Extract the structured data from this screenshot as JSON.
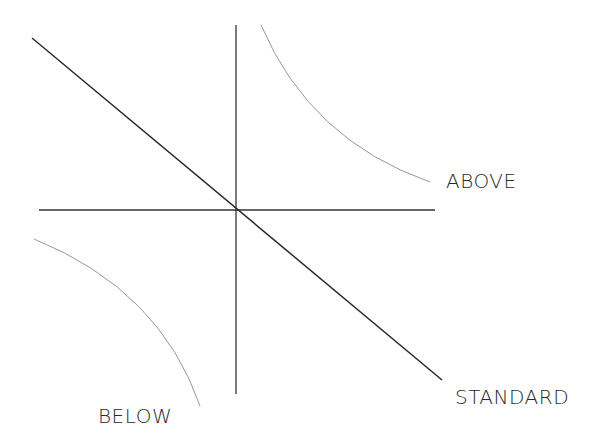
{
  "diagram": {
    "type": "quadrant-with-curves",
    "labels": {
      "above": "ABOVE",
      "standard": "STANDARD",
      "below": "BELOW"
    },
    "colors": {
      "axis": "#333333",
      "diagonal": "#2a2a2a",
      "curve": "#8a8a8a",
      "text": "#2a2a2a",
      "background": "#ffffff"
    },
    "elements": [
      {
        "name": "vertical-axis",
        "description": "Vertical line through center"
      },
      {
        "name": "horizontal-axis",
        "description": "Horizontal line through center"
      },
      {
        "name": "standard-line",
        "description": "Diagonal line from upper-left to lower-right through the axis origin",
        "label": "STANDARD"
      },
      {
        "name": "above-curve",
        "description": "Convex curve in upper-right quadrant",
        "label": "ABOVE"
      },
      {
        "name": "below-curve",
        "description": "Concave curve in lower-left quadrant",
        "label": "BELOW"
      }
    ]
  }
}
